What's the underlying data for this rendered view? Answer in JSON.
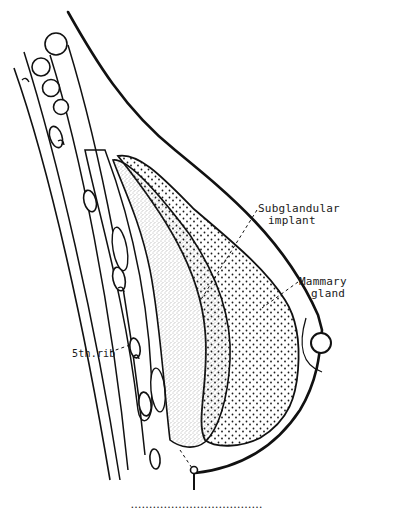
{
  "figure": {
    "colors": {
      "ink": "#111111",
      "implant_stipple": "#4a4a4a",
      "gland_stipple": "#1a1a1a",
      "background": "#ffffff"
    }
  },
  "labels": {
    "implant": {
      "line1": "Subglandular",
      "line2": "implant"
    },
    "gland": {
      "line1": "Mammary",
      "line2": "gland"
    },
    "rib": "5th.rib"
  },
  "caption": "………………………………"
}
